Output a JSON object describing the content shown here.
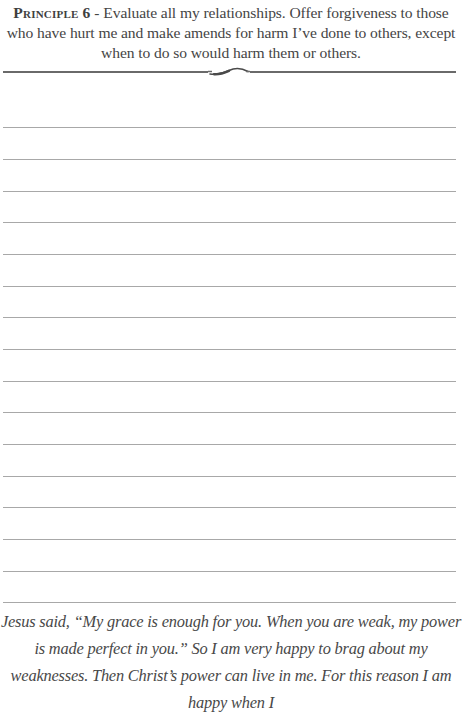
{
  "header": {
    "principle_label": "Principle 6",
    "separator": " - ",
    "principle_text": "Evaluate all my relationships. Offer forgiveness to those who have hurt me and make amends for harm I’ve done to others, except when to do so would harm them or others."
  },
  "divider": {
    "ornament_icon": "flourish-icon"
  },
  "writing_area": {
    "line_count": 16,
    "line_positions_px": [
      127,
      159,
      191,
      222,
      254,
      286,
      317,
      349,
      381,
      412,
      444,
      476,
      507,
      539,
      571,
      602
    ]
  },
  "quote": {
    "text": "Jesus said, “My grace is enough for you. When you are weak, my power is made perfect in you.” So I am very happy to brag about my weaknesses. Then Christ’s power can live in me. For this reason I am happy when I"
  },
  "colors": {
    "text": "#454545",
    "rule": "#6a6a6a",
    "writing_line": "#a8a8a8",
    "background": "#ffffff"
  }
}
